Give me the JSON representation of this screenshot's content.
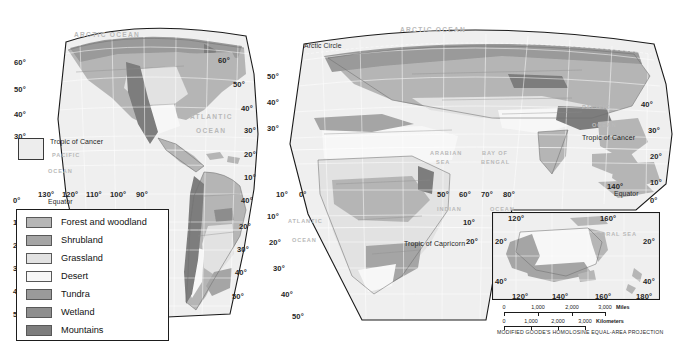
{
  "figure": {
    "projection_caption": "MODIFIED GOODE'S HOMOLOSINE EQUAL-AREA PROJECTION"
  },
  "legend": {
    "items": [
      {
        "label": "Forest and woodland",
        "color": "#b6b6b6"
      },
      {
        "label": "Shrubland",
        "color": "#a5a5a5"
      },
      {
        "label": "Grassland",
        "color": "#e2e2e2"
      },
      {
        "label": "Desert",
        "color": "#f7f7f7"
      },
      {
        "label": "Tundra",
        "color": "#9a9a9a"
      },
      {
        "label": "Wetland",
        "color": "#8e8e8e"
      },
      {
        "label": "Mountains",
        "color": "#7d7d7d"
      }
    ]
  },
  "americas_panel": {
    "lat_left": [
      "60°",
      "50°",
      "40°",
      "30°",
      "0°",
      "10°",
      "20°",
      "30°",
      "40°",
      "50°"
    ],
    "lat_right": [
      "60°",
      "50°",
      "40°",
      "30°",
      "20°",
      "10°",
      "40°",
      "20°",
      "30°",
      "40°",
      "50°"
    ],
    "lon_bottom": [
      "130°",
      "120°",
      "110°",
      "100°",
      "90°"
    ],
    "equator_label": "Equator",
    "tropic_of_cancer": "Tropic of Cancer",
    "oceans": [
      {
        "name": "ATLANTIC"
      },
      {
        "name": "OCEAN"
      },
      {
        "name": "PACIFIC"
      },
      {
        "name": "OCEAN"
      },
      {
        "name": "ARCTIC OCEAN"
      }
    ]
  },
  "world_panel": {
    "arctic_circle": "Arctic Circle",
    "arctic_ocean": "ARCTIC OCEAN",
    "lat_left": [
      "50°",
      "40°",
      "30°",
      "10°",
      "0°",
      "10°",
      "20°",
      "30°",
      "40°",
      "50°"
    ],
    "lat_right": [
      "40°",
      "30°",
      "20°",
      "10°",
      "0°"
    ],
    "lon_row": [
      "10°",
      "0°",
      "50°",
      "60°",
      "70°",
      "80°"
    ],
    "lon_india": [
      "60°",
      "70°",
      "80°",
      "90°"
    ],
    "lon_pacific": "140°",
    "equator_label": "Equator",
    "tropic_of_cancer": "Tropic of Cancer",
    "tropic_of_capricorn": "Tropic of Capricorn",
    "capricorn_lat": [
      "10°",
      "20°"
    ],
    "seas": [
      {
        "name": "ARABIAN"
      },
      {
        "name": "SEA"
      },
      {
        "name": "BAY OF"
      },
      {
        "name": "BENGAL"
      },
      {
        "name": "INDIAN"
      },
      {
        "name": "OCEAN"
      },
      {
        "name": "ATLANTIC"
      },
      {
        "name": "OCEAN"
      },
      {
        "name": "PACIFIC"
      },
      {
        "name": "OCEAN"
      }
    ]
  },
  "australia_inset": {
    "lon_top": [
      "120°",
      "160°"
    ],
    "lat_left": [
      "20°",
      "40°"
    ],
    "lat_right": [
      "20°",
      "40°"
    ],
    "lon_bottom": [
      "120°",
      "140°",
      "160°",
      "180°"
    ],
    "sea_label": "CORAL SEA",
    "scale_miles": {
      "ticks": [
        "0",
        "1,000",
        "2,000",
        "3,000"
      ],
      "unit": "Miles"
    },
    "scale_km": {
      "ticks": [
        "0",
        "1,000",
        "2,000",
        "3,000"
      ],
      "unit": "Kilometers"
    }
  }
}
